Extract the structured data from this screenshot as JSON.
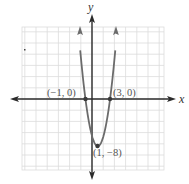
{
  "chart_data": {
    "type": "line",
    "title": "",
    "function": "f(x) = 2x^2 - 4x - 6",
    "xlabel": "x",
    "ylabel": "y",
    "grid": true,
    "xlim": [
      -11.5,
      11.5
    ],
    "ylim": [
      -12.5,
      12
    ],
    "series": [
      {
        "name": "parabola",
        "x": [
          -1.85,
          -1.5,
          -1,
          -0.5,
          0,
          0.5,
          1,
          1.5,
          2,
          2.5,
          3,
          3.5,
          3.85
        ],
        "y": [
          4.25,
          1.5,
          0,
          -3.5,
          -6,
          -7.5,
          -8,
          -7.5,
          -6,
          -3.5,
          0,
          3.5,
          4.25
        ]
      }
    ],
    "points": [
      {
        "x": -1,
        "y": 0,
        "label": "(−1, 0)"
      },
      {
        "x": 3,
        "y": 0,
        "label": "(3, 0)"
      },
      {
        "x": 1,
        "y": -8,
        "label": "(1, −8)"
      }
    ],
    "annotations": [
      "(−1, 0)",
      "(3, 0)",
      "(1, −8)"
    ]
  },
  "labels": {
    "x_axis": "x",
    "y_axis": "y",
    "point_left": "(−1, 0)",
    "point_right": "(3, 0)",
    "vertex": "(1, −8)"
  },
  "colors": {
    "curve": "#6b6b6b",
    "axis": "#2b2b2b",
    "grid": "#d9d9d9",
    "label": "#555555"
  }
}
